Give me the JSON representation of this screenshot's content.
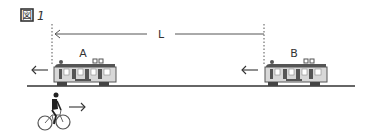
{
  "figure": {
    "label_kanji": "図",
    "label_number": "1"
  },
  "distance": {
    "label": "L"
  },
  "trains": [
    {
      "label": "A",
      "direction": "left"
    },
    {
      "label": "B",
      "direction": "left"
    }
  ],
  "cyclist": {
    "direction": "right"
  },
  "colors": {
    "line": "#444444",
    "train_body": "#d8d8d8",
    "train_dark": "#555555",
    "train_window": "#ffffff"
  }
}
